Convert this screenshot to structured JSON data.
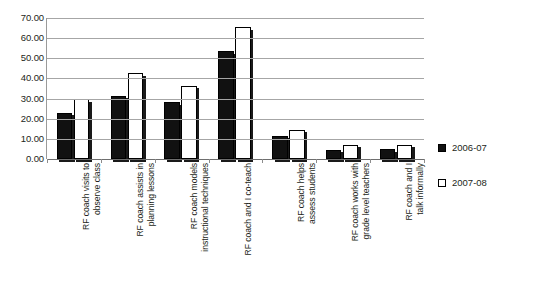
{
  "chart_data": {
    "type": "bar",
    "title": "",
    "subtitle": "",
    "xlabel": "",
    "ylabel": "",
    "ylim": [
      0,
      70
    ],
    "ytick_step": 10,
    "grid": true,
    "legend_position": "right",
    "ytick_labels": [
      "70.00",
      "60.00",
      "50.00",
      "40.00",
      "30.00",
      "20.00",
      "10.00",
      "0.00"
    ],
    "ytick_values": [
      70,
      60,
      50,
      40,
      30,
      20,
      10,
      0
    ],
    "categories": [
      "RF coach visits to observe class",
      "RF coach assists in planning lessons",
      "RF coach models instructional techniques",
      "RF coach and I co-teach",
      "RF coach helps assess students",
      "RF coach works with grade level teachers",
      "RF coach and I talk informally"
    ],
    "category_lines": [
      [
        "RF coach visits to",
        "observe class"
      ],
      [
        "RF coach assists in",
        "planning lessons"
      ],
      [
        "RF coach models",
        "instructional techniques"
      ],
      [
        "RF coach and I co-teach"
      ],
      [
        "RF coach helps",
        "assess students"
      ],
      [
        "RF coach works with",
        "grade level teachers"
      ],
      [
        "RF coach and I",
        "talk informally"
      ]
    ],
    "series": [
      {
        "name": "2006-07",
        "color": "#111111",
        "style": "filled",
        "values": [
          23.0,
          31.3,
          28.3,
          53.5,
          11.5,
          4.5,
          4.8
        ]
      },
      {
        "name": "2007-08",
        "color": "#ffffff",
        "style": "hollow",
        "values": [
          29.7,
          42.5,
          36.3,
          65.5,
          14.5,
          7.0,
          7.0
        ]
      }
    ]
  },
  "legend": {
    "items": [
      {
        "label": "2006-07",
        "swatch": "filled-square"
      },
      {
        "label": "2007-08",
        "swatch": "hollow-square"
      }
    ]
  }
}
